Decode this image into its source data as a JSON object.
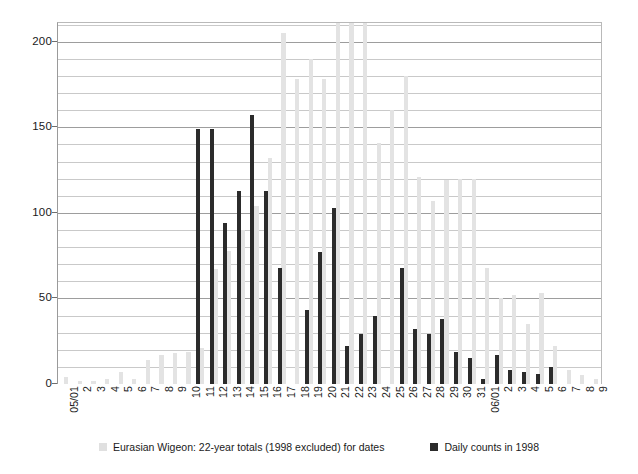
{
  "chart_data": {
    "type": "bar",
    "title": "",
    "subtitle": "",
    "xlabel": "",
    "ylabel": "",
    "ylim": [
      0,
      211
    ],
    "yticks": [
      0,
      50,
      100,
      150,
      200
    ],
    "ytick_labels": [
      "0",
      "50",
      "100",
      "150",
      "200"
    ],
    "minor_tick_step": 10,
    "grid": true,
    "legend_position": "bottom",
    "categories": [
      "05/01",
      "2",
      "3",
      "4",
      "5",
      "6",
      "7",
      "8",
      "9",
      "10",
      "11",
      "12",
      "13",
      "14",
      "15",
      "16",
      "17",
      "18",
      "19",
      "20",
      "21",
      "22",
      "23",
      "24",
      "25",
      "26",
      "27",
      "28",
      "29",
      "30",
      "31",
      "06/01",
      "2",
      "3",
      "4",
      "5",
      "6",
      "7",
      "8",
      "9"
    ],
    "series": [
      {
        "name": "Eurasian Wigeon: 22-year totals (1998 excluded) for dates",
        "color": "#e3e3e3",
        "clipped_at": 211,
        "values": [
          4,
          2,
          2,
          3,
          7,
          3,
          14,
          17,
          18,
          19,
          21,
          67,
          78,
          90,
          104,
          132,
          205,
          178,
          190,
          178,
          212,
          212,
          212,
          141,
          160,
          180,
          121,
          107,
          119,
          120,
          120,
          68,
          50,
          52,
          35,
          53,
          22,
          8,
          5,
          3
        ]
      },
      {
        "name": "Daily counts in 1998",
        "color": "#2b2b2b",
        "values": [
          0,
          0,
          0,
          0,
          0,
          0,
          0,
          0,
          0,
          0,
          149,
          149,
          94,
          113,
          157,
          113,
          68,
          0,
          43,
          77,
          103,
          22,
          29,
          40,
          0,
          68,
          32,
          29,
          38,
          19,
          15,
          3,
          17,
          8,
          7,
          6,
          10,
          0,
          0,
          0
        ]
      }
    ]
  },
  "legend": {
    "items": [
      {
        "label": "Eurasian Wigeon: 22-year totals (1998 excluded) for dates",
        "swatch": "totals"
      },
      {
        "label": "Daily counts in 1998",
        "swatch": "daily"
      }
    ]
  },
  "colors": {
    "totals_bar": "#e3e3e3",
    "daily_bar": "#2b2b2b",
    "gridline": "#c9c9c9",
    "gridline_major": "#9d9d9d",
    "axis": "#6e6e6e",
    "background": "#ffffff",
    "text": "#1a1a1a"
  }
}
